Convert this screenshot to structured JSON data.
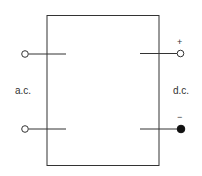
{
  "diagram": {
    "type": "rectifier-block",
    "input_label": "a.c.",
    "output_label": "d.c.",
    "positive_sign": "+",
    "negative_sign": "−",
    "colors": {
      "line": "#333333",
      "background": "#ffffff"
    },
    "terminals": [
      {
        "side": "left",
        "position": "top",
        "style": "open"
      },
      {
        "side": "left",
        "position": "bottom",
        "style": "open"
      },
      {
        "side": "right",
        "position": "top",
        "polarity": "+",
        "style": "open"
      },
      {
        "side": "right",
        "position": "bottom",
        "polarity": "−",
        "style": "filled"
      }
    ]
  }
}
